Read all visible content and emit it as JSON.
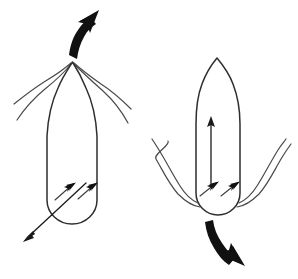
{
  "figure": {
    "background_color": "#ffffff",
    "ink_color": "#1a1a1a",
    "outline_color": "#2e2e30",
    "tentacle_color": "#4a4a4d",
    "width": 298,
    "height": 279,
    "panels": [
      {
        "id": "left-panel",
        "name": "water-intake-phase",
        "label": "",
        "body": {
          "name": "squid-mantle-body",
          "orientation": "tentacles-up",
          "shape": "capsule-with-pointed-top",
          "apex_x": 72,
          "apex_y": 62,
          "left_x": 47,
          "right_x": 97,
          "bottom_y": 222
        },
        "tentacles": {
          "name": "tentacle-cluster-top",
          "count": 4,
          "direction": "splayed-outward-downward"
        },
        "internal_arrows": {
          "name": "water-intake-jets",
          "count": 2,
          "direction": "up-right",
          "meaning": "water drawn into mantle cavity"
        },
        "thin_arrow": {
          "name": "water-intake-stream-arrow",
          "direction": "down-left",
          "start_x": 86,
          "start_y": 183,
          "end_x": 25,
          "end_y": 240
        },
        "motion_arrow": {
          "name": "motion-arrow-up",
          "direction": "up-left",
          "style": "bold-curved",
          "color": "#111111"
        }
      },
      {
        "id": "right-panel",
        "name": "water-expulsion-phase",
        "label": "",
        "body": {
          "name": "squid-mantle-body",
          "orientation": "tentacles-down",
          "shape": "capsule-with-pointed-top",
          "apex_x": 217,
          "apex_y": 58,
          "left_x": 196,
          "right_x": 240,
          "bottom_y": 215
        },
        "tentacles": {
          "name": "tentacle-cluster-bottom",
          "count": 4,
          "direction": "splayed-outward-upward"
        },
        "internal_arrows": {
          "name": "water-expulsion-jets",
          "count": 2,
          "direction": "up-right",
          "meaning": "water forced out of mantle cavity"
        },
        "thin_arrow": {
          "name": "internal-thrust-arrow-up",
          "direction": "up",
          "start_x": 211,
          "start_y": 183,
          "end_x": 211,
          "end_y": 117
        },
        "motion_arrow": {
          "name": "motion-arrow-down",
          "direction": "down-right",
          "style": "bold-curved",
          "color": "#111111"
        }
      }
    ]
  }
}
